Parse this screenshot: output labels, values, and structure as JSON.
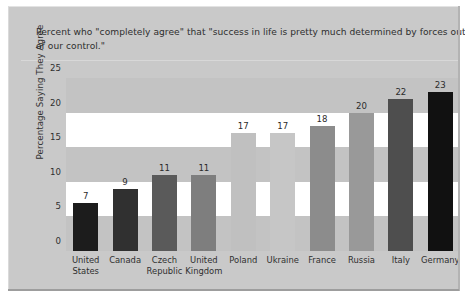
{
  "title": {
    "line1": "Percent who \"completely agree\" that \"success in life is pretty much determined by forces outside",
    "line2": "of our control.\""
  },
  "chart_data": {
    "type": "bar",
    "title": "Percent who \"completely agree\" that \"success in life is pretty much determined by forces outside of our control.\"",
    "xlabel": "",
    "ylabel": "Percentage Saying They Agree",
    "ylim": [
      0,
      25
    ],
    "yticks": [
      0,
      5,
      10,
      15,
      20,
      25
    ],
    "ytick_labels": [
      "0",
      "5",
      "10",
      "15",
      "20",
      "25"
    ],
    "grid": false,
    "banded_background": true,
    "legend": "none",
    "categories": [
      "United States",
      "Canada",
      "Czech Republic",
      "United Kingdom",
      "Poland",
      "Ukraine",
      "France",
      "Russia",
      "Italy",
      "Germany"
    ],
    "category_lines": [
      [
        "United",
        "States"
      ],
      [
        "Canada",
        ""
      ],
      [
        "Czech",
        "Republic"
      ],
      [
        "United",
        "Kingdom"
      ],
      [
        "Poland",
        ""
      ],
      [
        "Ukraine",
        ""
      ],
      [
        "France",
        ""
      ],
      [
        "Russia",
        ""
      ],
      [
        "Italy",
        ""
      ],
      [
        "Germany",
        ""
      ]
    ],
    "values": [
      7,
      9,
      11,
      11,
      17,
      17,
      18,
      20,
      22,
      23
    ],
    "value_labels": [
      "7",
      "9",
      "11",
      "11",
      "17",
      "17",
      "18",
      "20",
      "22",
      "23"
    ],
    "bar_colors": [
      "#1c1c1c",
      "#303030",
      "#5a5a5a",
      "#7e7e7e",
      "#c0c0c0",
      "#c6c6c6",
      "#8c8c8c",
      "#999999",
      "#4e4e4e",
      "#111111"
    ]
  },
  "colors": {
    "panel_background": "#c9c9c9",
    "plot_band_light": "#ffffff",
    "plot_band_dark": "#c3c3c3",
    "text": "#2e2e2e"
  }
}
